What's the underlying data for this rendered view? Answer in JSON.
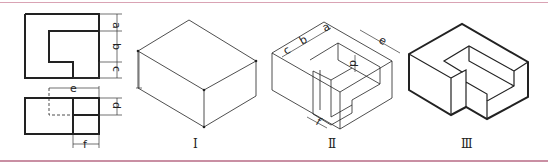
{
  "figure": {
    "border_color": "#c98fa3",
    "line_color": "#222222",
    "views": {
      "orthographic": {
        "dimension_labels": {
          "a": "a",
          "b": "b",
          "c": "c",
          "d": "d",
          "e": "e",
          "f": "f"
        }
      },
      "step_1": {
        "label": "Ⅰ"
      },
      "step_2": {
        "label": "Ⅱ",
        "dimension_labels": {
          "a": "a",
          "b": "b",
          "c": "c",
          "d": "d",
          "e": "e",
          "f": "f"
        }
      },
      "step_3": {
        "label": "Ⅲ"
      }
    }
  }
}
